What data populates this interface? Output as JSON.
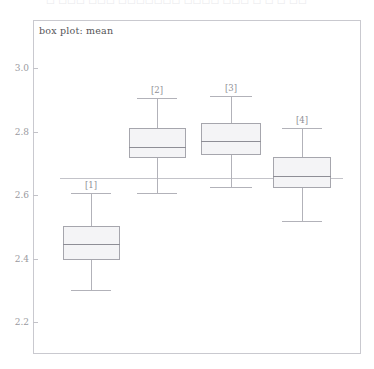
{
  "window": {
    "ghost_header_text": "□ □□□ □□□ □□□□□□□ □□□□ □□□ □ □ □ □□"
  },
  "panel": {
    "title": "box plot: mean"
  },
  "chart_data": {
    "type": "box",
    "title": "box plot: mean",
    "xlabel": "",
    "ylabel": "",
    "ylim": [
      2.15,
      3.05
    ],
    "yticks": [
      3.0,
      2.8,
      2.6,
      2.4,
      2.2
    ],
    "ytick_labels": [
      "3.0",
      "2.8",
      "2.6",
      "2.4",
      "2.2"
    ],
    "grid": false,
    "legend": "none",
    "reference_line": {
      "label": "overall mean",
      "value": 2.655,
      "orientation": "horizontal"
    },
    "categories": [
      "[1]",
      "[2]",
      "[3]",
      "[4]"
    ],
    "boxes": [
      {
        "label": "[1]",
        "whisker_low": 2.3,
        "q1": 2.395,
        "median": 2.447,
        "q3": 2.502,
        "whisker_high": 2.607
      },
      {
        "label": "[2]",
        "whisker_low": 2.607,
        "q1": 2.716,
        "median": 2.752,
        "q3": 2.812,
        "whisker_high": 2.907
      },
      {
        "label": "[3]",
        "whisker_low": 2.626,
        "q1": 2.726,
        "median": 2.77,
        "q3": 2.827,
        "whisker_high": 2.913
      },
      {
        "label": "[4]",
        "whisker_low": 2.517,
        "q1": 2.622,
        "median": 2.66,
        "q3": 2.719,
        "whisker_high": 2.812
      }
    ]
  }
}
